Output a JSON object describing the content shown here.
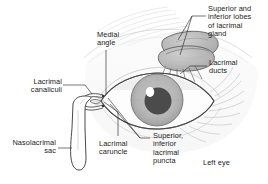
{
  "figure": {
    "view_label": "Left eye",
    "background_color": "#ffffff",
    "ink_color": "#1b1b1b"
  },
  "labels": {
    "lacrimal_gland_lobes": "Superior and\ninferior lobes\nof lacrimal\ngland",
    "lacrimal_ducts": "Lacrimal\nducts",
    "medial_angle": "Medial\nangle",
    "lacrimal_canaliculi": "Lacrimal\ncanaliculi",
    "nasolacrimal_sac": "Nasolacrimal\nsac",
    "lacrimal_caruncle": "Lacrimal\ncaruncle",
    "lacrimal_puncta": "Superior,\ninferior\nlacrimal\npuncta",
    "left_eye": "Left eye"
  },
  "anatomy": {
    "iris_color": "#b7b7b7",
    "pupil_color": "#4b4b4b",
    "highlight_color": "#ffffff",
    "gland_fill": "#b9b9b9",
    "sclera_color": "#fdfdfd",
    "skin_shade": "#ededed",
    "lash_color": "#c9c9c9"
  }
}
